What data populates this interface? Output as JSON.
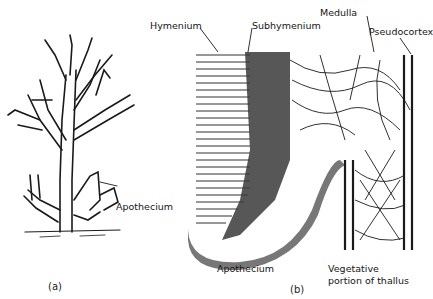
{
  "figure": {
    "panels": [
      {
        "id": "a",
        "caption": "(a)",
        "subject": "branching lichen thallus",
        "labels": [
          {
            "text": "Apothecium"
          }
        ]
      },
      {
        "id": "b",
        "caption": "(b)",
        "subject": "section through apothecium and thallus",
        "labels": [
          {
            "text": "Hymenium"
          },
          {
            "text": "Subhymenium"
          },
          {
            "text": "Medulla"
          },
          {
            "text": "Pseudocortex"
          },
          {
            "text": "Apothecium"
          },
          {
            "text": "Vegetative"
          },
          {
            "text": "portion of thallus"
          }
        ]
      }
    ]
  },
  "colors": {
    "ink": "#151515",
    "paper": "#ffffff"
  }
}
